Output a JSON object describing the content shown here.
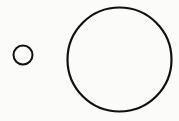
{
  "diagram": {
    "background": "#fbfbfa",
    "stroke_color": "#111111",
    "shapes": [
      {
        "type": "circle",
        "name": "small-circle",
        "cx": 23,
        "cy": 55,
        "r": 9.5,
        "stroke_width": 2
      },
      {
        "type": "circle",
        "name": "large-circle",
        "cx": 119.5,
        "cy": 59.5,
        "r": 52,
        "stroke_width": 2.2
      }
    ]
  }
}
